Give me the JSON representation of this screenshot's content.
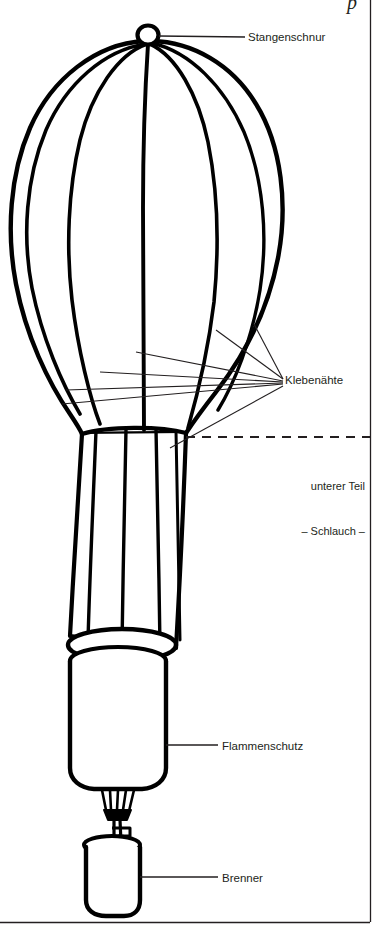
{
  "figure": {
    "type": "technical-line-diagram",
    "line_color": "#000000",
    "leader_color": "#231f20",
    "text_color": "#231f20",
    "background": "#ffffff",
    "corner_mark": "p"
  },
  "labels": {
    "crown_line": "Stangenschnur",
    "seams": "Klebenähte",
    "lower_part_line1": "unterer Teil",
    "lower_part_line2": "– Schlauch –",
    "flame_guard": "Flammenschutz",
    "burner": "Brenner"
  },
  "parts": [
    {
      "id": "crown-ring",
      "label": "Stangenschnur"
    },
    {
      "id": "envelope-seams",
      "label": "Klebenähte"
    },
    {
      "id": "skirt",
      "label": "unterer Teil – Schlauch –"
    },
    {
      "id": "flame-guard",
      "label": "Flammenschutz"
    },
    {
      "id": "burner",
      "label": "Brenner"
    }
  ]
}
